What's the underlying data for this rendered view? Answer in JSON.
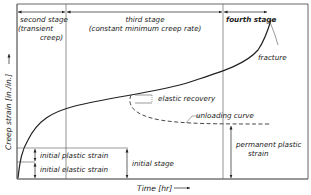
{
  "diagram": {
    "type": "creep-curve",
    "stages": {
      "second": [
        "second stage",
        "(transient",
        "creep)"
      ],
      "third": [
        "third stage",
        "(constant minimum creep rate)"
      ],
      "fourth": "fourth stage"
    },
    "annotations": {
      "fracture": "fracture",
      "elastic_recovery": "elastic recovery",
      "unloading_curve": "unloading curve",
      "permanent_plastic_strain": [
        "permanent plastic",
        "strain"
      ],
      "initial_plastic_strain": "initial plastic strain",
      "initial_elastic_strain": "initial elastic strain",
      "initial_stage": "initial stage"
    },
    "axes": {
      "y_label": "Creep strain [in./in.]",
      "x_label": "Time [hr]"
    },
    "colors": {
      "line": "#222222",
      "frame": "#555555",
      "background": "#ffffff"
    }
  }
}
